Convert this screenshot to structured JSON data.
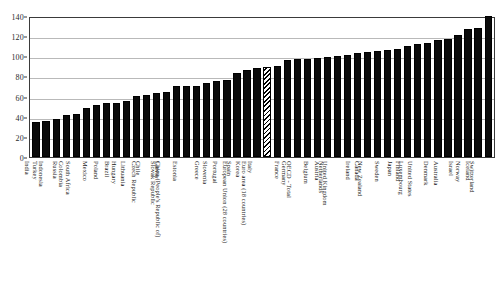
{
  "chart_data": {
    "type": "bar",
    "title": "",
    "xlabel": "",
    "ylabel": "",
    "ylim": [
      0,
      140
    ],
    "y_ticks": [
      0,
      20,
      40,
      60,
      80,
      100,
      120,
      140
    ],
    "grid": true,
    "legend": "none",
    "bar_color": "#0b0b0b",
    "highlight_style": "hatched",
    "categories": [
      "India",
      "Turkey",
      "Indonesia",
      "Russia",
      "Colombia",
      "South Africa",
      "Mexico",
      "Poland",
      "Brazil",
      "Hungary",
      "Lithuania",
      "Chile",
      "Czech Republic",
      "Latvia",
      "Slovak Republic",
      "Estonia",
      "China (People's Republic of)",
      "Greece",
      "Slovenia",
      "Portugal",
      "Spain",
      "Korea",
      "Italy",
      "European Union (28 countries)",
      "Euro area (18 countries)",
      "France",
      "Germany",
      "OECD - Total",
      "Belgium",
      "Austria",
      "Netherlands",
      "United Kingdom",
      "Ireland",
      "Canada",
      "New Zealand",
      "Sweden",
      "Japan",
      "Finland",
      "Luxembourg",
      "United States",
      "Denmark",
      "Australia",
      "Israel",
      "Norway",
      "Iceland",
      "Switzerland"
    ],
    "values": [
      35,
      36,
      38,
      42,
      43,
      49,
      52,
      54,
      54,
      56,
      61,
      62,
      64,
      65,
      71,
      71,
      71,
      73,
      75,
      76,
      83,
      86,
      88,
      89,
      90,
      96,
      97,
      97,
      98,
      99,
      100,
      101,
      103,
      104,
      105,
      106,
      107,
      110,
      112,
      113,
      116,
      117,
      121,
      127,
      128,
      140
    ],
    "highlighted_categories": [
      "European Union (28 countries)"
    ]
  }
}
